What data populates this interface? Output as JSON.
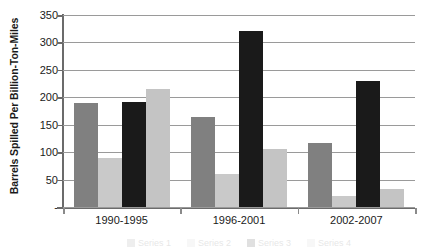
{
  "chart_data": {
    "type": "bar",
    "title": "",
    "subtitle": "",
    "xlabel": "",
    "ylabel": "Barrels Spilled Per Billion-Ton-Miles",
    "ylim": [
      0,
      350
    ],
    "yticks": [
      0,
      50,
      100,
      150,
      200,
      250,
      300,
      350
    ],
    "ytick_labels": [
      "-",
      "50",
      "100",
      "150",
      "200",
      "250",
      "300",
      "350"
    ],
    "grid": true,
    "legend_position": "bottom",
    "categories": [
      "1990-1995",
      "1996-2001",
      "2002-2007"
    ],
    "series": [
      {
        "name": "Series 1",
        "color": "#808080",
        "values": [
          190,
          164,
          117
        ]
      },
      {
        "name": "Series 2",
        "color": "#c9c9c9",
        "values": [
          90,
          61,
          20
        ]
      },
      {
        "name": "Series 3",
        "color": "#1a1a1a",
        "values": [
          191,
          320,
          229
        ]
      },
      {
        "name": "Series 4",
        "color": "#c4c4c4",
        "values": [
          215,
          105,
          33
        ]
      }
    ]
  },
  "axis": {
    "y_title": "Barrels Spilled Per Billion-Ton-Miles"
  },
  "colors": {
    "background": "#ffffff",
    "gridline": "#9a9a9a",
    "axis": "#6b6b6b",
    "text": "#1a1a1a"
  }
}
